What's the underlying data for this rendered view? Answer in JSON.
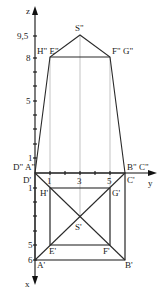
{
  "axes": {
    "z_label": "z",
    "y_label": "y",
    "x_label": "x",
    "z_ticks": [
      "9,5",
      "8",
      "5",
      "1"
    ],
    "y_ticks": [
      "1",
      "3",
      "5"
    ],
    "x_ticks": [
      "1",
      "5",
      "6"
    ]
  },
  "elevation_labels": {
    "apex": "S\"",
    "top_left": "H\" E\"",
    "top_right": "F\" G\"",
    "base_left": "D\" A\"",
    "base_right": "B\" C\""
  },
  "plan_labels": {
    "d": "D'",
    "c": "C'",
    "h": "H'",
    "g": "G'",
    "s": "S'",
    "e": "E'",
    "f": "F'",
    "a": "A'",
    "b": "B'"
  }
}
